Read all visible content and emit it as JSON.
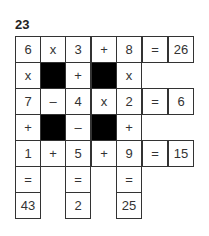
{
  "puzzle": {
    "number": "23",
    "grid": [
      [
        "6",
        "x",
        "3",
        "+",
        "8",
        "=",
        "26"
      ],
      [
        "x",
        "#",
        "+",
        "#",
        "x",
        "",
        ""
      ],
      [
        "7",
        "–",
        "4",
        "x",
        "2",
        "=",
        "6"
      ],
      [
        "+",
        "#",
        "–",
        "#",
        "+",
        "",
        ""
      ],
      [
        "1",
        "+",
        "5",
        "+",
        "9",
        "=",
        "15"
      ],
      [
        "=",
        "",
        "=",
        "",
        "=",
        "",
        ""
      ],
      [
        "43",
        "",
        "2",
        "",
        "25",
        "",
        ""
      ]
    ]
  }
}
